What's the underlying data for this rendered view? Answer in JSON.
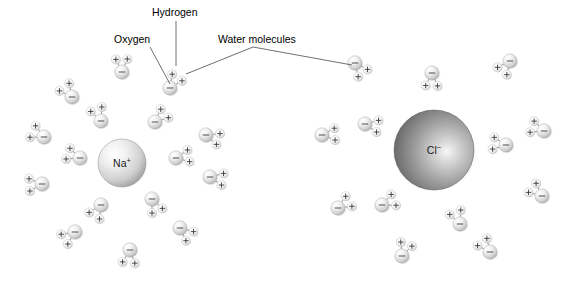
{
  "figure": {
    "background_color": "#ffffff",
    "width": 572,
    "height": 287
  },
  "labels": [
    {
      "id": "hydrogen",
      "text": "Hydrogen",
      "x": 152,
      "y": 16,
      "anchor": "start",
      "leader": "M 176 21 L 176 66"
    },
    {
      "id": "oxygen",
      "text": "Oxygen",
      "x": 114,
      "y": 43,
      "anchor": "start",
      "leader": "M 150 47 L 170 84"
    },
    {
      "id": "water-molecules",
      "text": "Water molecules",
      "x": 218,
      "y": 43,
      "anchor": "start",
      "leader": "M 253 47 L 186 74 M 253 47 L 352 65"
    }
  ],
  "ions": [
    {
      "id": "sodium-ion",
      "symbol": "Na",
      "charge": "+",
      "cx": 122,
      "cy": 163,
      "r": 24,
      "fill_light": "#f2f2f2",
      "fill_dark": "#9a9a9a",
      "highlight_x": "34%",
      "highlight_y": "30%",
      "label_dy": 4
    },
    {
      "id": "chloride-ion",
      "symbol": "Cl",
      "charge": "−",
      "cx": 434,
      "cy": 150,
      "r": 40,
      "fill_light": "#e6e6e6",
      "fill_dark": "#5e5e5e",
      "highlight_x": "66%",
      "highlight_y": "52%",
      "label_dy": 4
    }
  ],
  "molecule_style": {
    "oxygen_radius": 7.2,
    "hydrogen_radius": 4.6,
    "oxygen_fill_light": "#fcfcfc",
    "oxygen_fill_dark": "#a8a8a8",
    "hydrogen_fill_light": "#fdfdfd",
    "hydrogen_fill_dark": "#c4c4c4",
    "oxygen_sign": "−",
    "hydrogen_sign": "+",
    "bond_length": 14
  },
  "water_molecules": {
    "sodium_shell": [
      {
        "ox": 122,
        "oy": 72,
        "rot": 268,
        "spread": 48
      },
      {
        "ox": 170,
        "oy": 88,
        "rot": 304,
        "spread": 50
      },
      {
        "ox": 72,
        "oy": 97,
        "rot": 232,
        "spread": 52
      },
      {
        "ox": 101,
        "oy": 121,
        "rot": 248,
        "spread": 50
      },
      {
        "ox": 155,
        "oy": 122,
        "rot": 318,
        "spread": 48
      },
      {
        "ox": 44,
        "oy": 137,
        "rot": 206,
        "spread": 54
      },
      {
        "ox": 80,
        "oy": 158,
        "rot": 200,
        "spread": 48
      },
      {
        "ox": 42,
        "oy": 184,
        "rot": 176,
        "spread": 52
      },
      {
        "ox": 176,
        "oy": 158,
        "rot": 350,
        "spread": 50
      },
      {
        "ox": 206,
        "oy": 135,
        "rot": 18,
        "spread": 48
      },
      {
        "ox": 210,
        "oy": 177,
        "rot": 10,
        "spread": 50
      },
      {
        "ox": 101,
        "oy": 205,
        "rot": 122,
        "spread": 52
      },
      {
        "ox": 75,
        "oy": 232,
        "rot": 146,
        "spread": 50
      },
      {
        "ox": 152,
        "oy": 199,
        "rot": 66,
        "spread": 48
      },
      {
        "ox": 180,
        "oy": 228,
        "rot": 40,
        "spread": 50
      },
      {
        "ox": 130,
        "oy": 250,
        "rot": 96,
        "spread": 52
      }
    ],
    "chloride_shell": [
      {
        "ox": 432,
        "oy": 73,
        "rot": 92,
        "spread": 50
      },
      {
        "ox": 355,
        "oy": 63,
        "rot": 52,
        "spread": 50
      },
      {
        "ox": 510,
        "oy": 61,
        "rot": 128,
        "spread": 50
      },
      {
        "ox": 365,
        "oy": 124,
        "rot": 10,
        "spread": 50
      },
      {
        "ox": 322,
        "oy": 135,
        "rot": 356,
        "spread": 50
      },
      {
        "ox": 506,
        "oy": 145,
        "rot": 188,
        "spread": 50
      },
      {
        "ox": 544,
        "oy": 131,
        "rot": 200,
        "spread": 50
      },
      {
        "ox": 542,
        "oy": 196,
        "rot": 220,
        "spread": 50
      },
      {
        "ox": 382,
        "oy": 205,
        "rot": 336,
        "spread": 50
      },
      {
        "ox": 338,
        "oy": 208,
        "rot": 328,
        "spread": 50
      },
      {
        "ox": 460,
        "oy": 224,
        "rot": 248,
        "spread": 50
      },
      {
        "ox": 490,
        "oy": 252,
        "rot": 232,
        "spread": 50
      },
      {
        "ox": 402,
        "oy": 256,
        "rot": 290,
        "spread": 50
      }
    ]
  }
}
